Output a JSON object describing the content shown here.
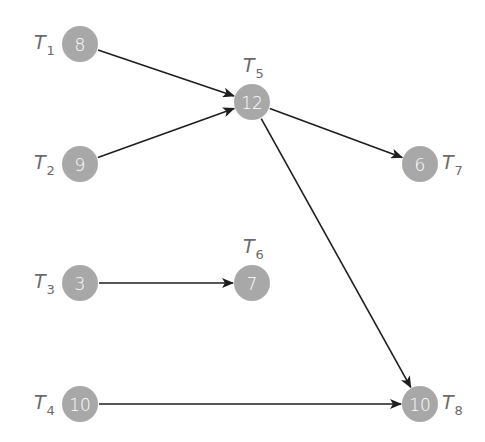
{
  "diagram": {
    "type": "task-dependency-graph",
    "colors": {
      "node": "#a8a8a8",
      "node_text": "#ffffff",
      "label": "#6a6a6a",
      "edge": "#1e1e1e",
      "background": "#ffffff"
    },
    "nodes": [
      {
        "id": "T1",
        "label": "T",
        "sub": "1",
        "value": "8",
        "cx": 80,
        "cy": 44,
        "label_pos": "left"
      },
      {
        "id": "T2",
        "label": "T",
        "sub": "2",
        "value": "9",
        "cx": 80,
        "cy": 164,
        "label_pos": "left"
      },
      {
        "id": "T3",
        "label": "T",
        "sub": "3",
        "value": "3",
        "cx": 80,
        "cy": 283,
        "label_pos": "left"
      },
      {
        "id": "T4",
        "label": "T",
        "sub": "4",
        "value": "10",
        "cx": 80,
        "cy": 404,
        "label_pos": "left"
      },
      {
        "id": "T5",
        "label": "T",
        "sub": "5",
        "value": "12",
        "cx": 252,
        "cy": 102,
        "label_pos": "top"
      },
      {
        "id": "T6",
        "label": "T",
        "sub": "6",
        "value": "7",
        "cx": 252,
        "cy": 283,
        "label_pos": "top"
      },
      {
        "id": "T7",
        "label": "T",
        "sub": "7",
        "value": "6",
        "cx": 420,
        "cy": 164,
        "label_pos": "right"
      },
      {
        "id": "T8",
        "label": "T",
        "sub": "8",
        "value": "10",
        "cx": 420,
        "cy": 404,
        "label_pos": "right"
      }
    ],
    "edges": [
      {
        "from": "T1",
        "to": "T5"
      },
      {
        "from": "T2",
        "to": "T5"
      },
      {
        "from": "T5",
        "to": "T7"
      },
      {
        "from": "T5",
        "to": "T8"
      },
      {
        "from": "T3",
        "to": "T6"
      },
      {
        "from": "T4",
        "to": "T8"
      }
    ]
  }
}
